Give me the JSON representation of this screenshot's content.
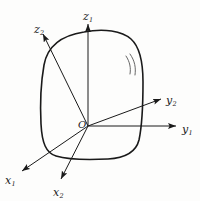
{
  "figure": {
    "type": "3d-coordinate-frames-on-rigid-body",
    "background_color": "#fdfdfc",
    "line_color": "#1a1a1a",
    "origin": {
      "label": "O",
      "x": 88,
      "y": 126
    },
    "body": {
      "name": "rigid-body-outline",
      "shape": "rounded-blob",
      "stroke_width": 1.6
    },
    "arc_marks": {
      "name": "surface-arc-marks",
      "count": 2
    },
    "axes": [
      {
        "name": "z-axis-1",
        "var": "z",
        "sub": "1",
        "tip_x": 88,
        "tip_y": 22,
        "label_x": 83,
        "label_y": 7
      },
      {
        "name": "z-axis-2",
        "var": "z",
        "sub": "2",
        "tip_x": 42,
        "tip_y": 33,
        "label_x": 34,
        "label_y": 20
      },
      {
        "name": "y-axis-2",
        "var": "y",
        "sub": "2",
        "tip_x": 163,
        "tip_y": 98,
        "label_x": 166,
        "label_y": 91
      },
      {
        "name": "y-axis-1",
        "var": "y",
        "sub": "1",
        "tip_x": 178,
        "tip_y": 126,
        "label_x": 182,
        "label_y": 120
      },
      {
        "name": "x-axis-1",
        "var": "x",
        "sub": "1",
        "tip_x": 20,
        "tip_y": 172,
        "label_x": 5,
        "label_y": 171
      },
      {
        "name": "x-axis-2",
        "var": "x",
        "sub": "2",
        "tip_x": 60,
        "tip_y": 181,
        "label_x": 53,
        "label_y": 183
      }
    ]
  }
}
